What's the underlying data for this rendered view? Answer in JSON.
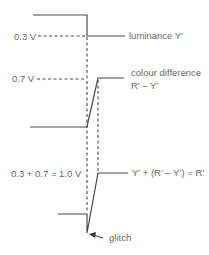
{
  "diagram": {
    "labels": {
      "v03": "0.3 V",
      "v07": "0.7 V",
      "sum": "0.3  + 0.7 = 1.0 V",
      "luminance": "luminance Y’",
      "colour_diff_line1": "colour difference",
      "colour_diff_line2": "R’ – Y’",
      "result": "Y’ + (R’ – Y’) = R’",
      "glitch": "glitch"
    },
    "colors": {
      "line": "#4a4a4a",
      "text": "#6a6a6a"
    }
  }
}
